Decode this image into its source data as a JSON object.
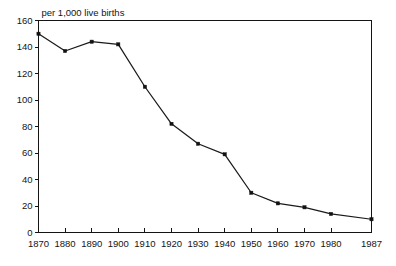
{
  "chart_data": {
    "type": "line",
    "title": "per 1,000 live births",
    "xlabel": "",
    "ylabel": "",
    "xlim": [
      1870,
      1987
    ],
    "ylim": [
      0,
      160
    ],
    "yticks": [
      0,
      20,
      40,
      60,
      80,
      100,
      120,
      140,
      160
    ],
    "grid": false,
    "legend": null,
    "categories": [
      "1870",
      "1880",
      "1890",
      "1900",
      "1910",
      "1920",
      "1930",
      "1940",
      "1950",
      "1960",
      "1970",
      "1980",
      "1987"
    ],
    "x": [
      1870,
      1880,
      1890,
      1900,
      1910,
      1920,
      1930,
      1940,
      1950,
      1960,
      1970,
      1980,
      1987
    ],
    "values": [
      150,
      137,
      144,
      142,
      110,
      82,
      67,
      59,
      30,
      22,
      19,
      14,
      10
    ],
    "series": [
      {
        "name": "Infant mortality rate",
        "values": [
          150,
          137,
          144,
          142,
          110,
          82,
          67,
          59,
          30,
          22,
          19,
          14,
          10
        ]
      }
    ],
    "marker": "square",
    "line_color": "#1a1a1a",
    "marker_color": "#121212",
    "background_color": "#ffffff"
  },
  "axes": {
    "y_tick_labels": [
      "0",
      "20",
      "40",
      "60",
      "80",
      "100",
      "120",
      "140",
      "160"
    ],
    "x_tick_labels": [
      "1870",
      "1880",
      "1890",
      "1900",
      "1910",
      "1920",
      "1930",
      "1940",
      "1950",
      "1960",
      "1970",
      "1980",
      "1987"
    ]
  }
}
